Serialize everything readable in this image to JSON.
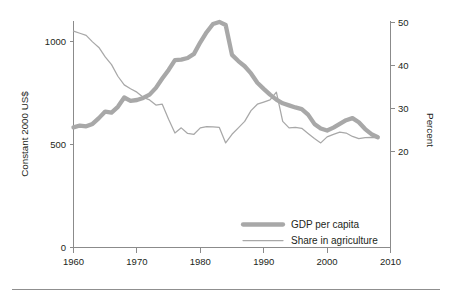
{
  "chart_data": {
    "type": "line",
    "title": "",
    "xlabel": "",
    "ylabel": "Constant 2000 US$",
    "y2label": "Percent",
    "xlim": [
      1960,
      2010
    ],
    "ylim": [
      0,
      1150
    ],
    "y2lim": [
      0,
      53
    ],
    "grid": false,
    "legend_position": "inside-bottom-right",
    "x_ticks": [
      1960,
      1970,
      1980,
      1990,
      2000,
      2010
    ],
    "x_tick_labels": [
      "1960",
      "1970",
      "1980",
      "1990",
      "2000",
      "2010"
    ],
    "y_ticks": [
      0,
      500,
      1000
    ],
    "y_tick_labels": [
      "0",
      "500",
      "1000"
    ],
    "y2_ticks": [
      20,
      30,
      40,
      50
    ],
    "y2_tick_labels": [
      "20",
      "30",
      "40",
      "50"
    ],
    "x": [
      1960,
      1961,
      1962,
      1963,
      1964,
      1965,
      1966,
      1967,
      1968,
      1969,
      1970,
      1971,
      1972,
      1973,
      1974,
      1975,
      1976,
      1977,
      1978,
      1979,
      1980,
      1981,
      1982,
      1983,
      1984,
      1985,
      1986,
      1987,
      1988,
      1989,
      1990,
      1991,
      1992,
      1993,
      1994,
      1995,
      1996,
      1997,
      1998,
      1999,
      2000,
      2001,
      2002,
      2003,
      2004,
      2005,
      2006,
      2007,
      2008
    ],
    "series": [
      {
        "name": "GDP per capita",
        "axis": "left",
        "unit": "Constant 2000 US$",
        "style": "thick",
        "color": "#a8a8a8",
        "values": [
          583,
          592,
          588,
          600,
          628,
          660,
          655,
          683,
          728,
          712,
          716,
          726,
          742,
          775,
          820,
          862,
          910,
          912,
          920,
          940,
          996,
          1045,
          1085,
          1095,
          1080,
          935,
          905,
          880,
          845,
          800,
          770,
          742,
          718,
          700,
          690,
          680,
          672,
          645,
          600,
          578,
          568,
          582,
          600,
          618,
          628,
          608,
          575,
          550,
          535
        ]
      },
      {
        "name": "Share in agriculture",
        "axis": "right",
        "unit": "Percent",
        "style": "thin",
        "color": "#a8a8a8",
        "values": [
          48.0,
          47.5,
          47.0,
          45.5,
          44.2,
          42.0,
          40.2,
          37.5,
          35.5,
          34.6,
          33.8,
          32.6,
          32.0,
          30.8,
          31.0,
          27.5,
          24.3,
          25.5,
          24.2,
          24.0,
          25.5,
          25.8,
          25.7,
          25.6,
          22.0,
          24.0,
          25.5,
          27.0,
          29.5,
          31.0,
          31.5,
          32.0,
          33.8,
          27.0,
          25.5,
          25.6,
          25.4,
          24.2,
          23.0,
          22.0,
          23.4,
          24.0,
          24.5,
          24.3,
          23.5,
          23.0,
          23.2,
          23.3,
          23.2
        ]
      }
    ],
    "legend": [
      {
        "label": "GDP per capita",
        "style": "thick",
        "color": "#a8a8a8"
      },
      {
        "label": "Share in agriculture",
        "style": "thin",
        "color": "#a8a8a8"
      }
    ]
  },
  "colors": {
    "series": "#a8a8a8",
    "axis": "#8b8b8b",
    "text": "#231f20",
    "background": "#ffffff"
  }
}
